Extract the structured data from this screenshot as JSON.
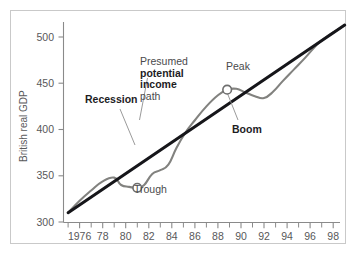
{
  "chart_data": {
    "type": "line",
    "title": "",
    "xlabel": "",
    "ylabel": "British real GDP",
    "xlim": [
      1975,
      1999
    ],
    "ylim": [
      300,
      515
    ],
    "grid": false,
    "legend": "none",
    "x_tick_labels": [
      "1976",
      "78",
      "80",
      "82",
      "84",
      "86",
      "88",
      "90",
      "92",
      "94",
      "96",
      "98"
    ],
    "x_tick_values": [
      1976,
      1978,
      1980,
      1982,
      1984,
      1986,
      1988,
      1990,
      1992,
      1994,
      1996,
      1998
    ],
    "x_minor_tick_values": [
      1975,
      1977,
      1979,
      1981,
      1983,
      1985,
      1987,
      1989,
      1991,
      1993,
      1995,
      1997,
      1999
    ],
    "y_tick_labels": [
      "300",
      "350",
      "400",
      "450",
      "500"
    ],
    "y_tick_values": [
      300,
      350,
      400,
      450,
      500
    ],
    "series": [
      {
        "name": "British real GDP",
        "color": "#82827f",
        "x": [
          1975.0,
          1976.0,
          1977.0,
          1978.0,
          1979.0,
          1979.6,
          1980.3,
          1981.0,
          1981.6,
          1982.3,
          1983.0,
          1983.7,
          1984.4,
          1985.2,
          1986.0,
          1987.0,
          1988.0,
          1988.8,
          1989.6,
          1990.4,
          1991.2,
          1992.0,
          1992.8,
          1993.6,
          1994.6,
          1995.6,
          1996.6,
          1997.4,
          1998.4,
          1999.0
        ],
        "y": [
          310,
          323,
          334,
          344,
          348,
          340,
          338,
          337,
          340,
          352,
          356,
          362,
          380,
          397,
          410,
          425,
          437,
          443,
          444,
          440,
          436,
          434,
          441,
          452,
          465,
          478,
          492,
          500,
          508,
          513
        ]
      },
      {
        "name": "Presumed potential income path",
        "color": "#16161a",
        "x": [
          1975.0,
          1999.0
        ],
        "y": [
          310,
          513
        ]
      }
    ],
    "markers": [
      {
        "label": "Trough",
        "x": 1981.0,
        "y": 337
      },
      {
        "label": "Peak",
        "x": 1988.8,
        "y": 443
      }
    ],
    "annotations": [
      {
        "name": "potential-path-annotation",
        "line1": "Presumed",
        "line2": "potential",
        "line3": "income",
        "line4": "path"
      },
      {
        "name": "recession-annotation",
        "text": "Recession"
      },
      {
        "name": "boom-annotation",
        "text": "Boom"
      },
      {
        "name": "peak-annotation",
        "text": "Peak"
      },
      {
        "name": "trough-annotation",
        "text": "Trough"
      }
    ]
  },
  "labels": {
    "y_axis_title": "British real GDP",
    "recession": "Recession",
    "boom": "Boom",
    "peak": "Peak",
    "trough": "Trough",
    "presumed": "Presumed",
    "potential": "potential",
    "income": "income",
    "path": "path",
    "y_300": "300",
    "y_350": "350",
    "y_400": "400",
    "y_450": "450",
    "y_500": "500",
    "x_1976": "1976",
    "x_78": "78",
    "x_80": "80",
    "x_82": "82",
    "x_84": "84",
    "x_86": "86",
    "x_88": "88",
    "x_90": "90",
    "x_92": "92",
    "x_94": "94",
    "x_96": "96",
    "x_98": "98"
  },
  "colors": {
    "gdp_curve": "#82827f",
    "trend_line": "#16161a",
    "axis": "#8a8a8a",
    "frame": "#c9c9c9",
    "text": "#58585a"
  }
}
